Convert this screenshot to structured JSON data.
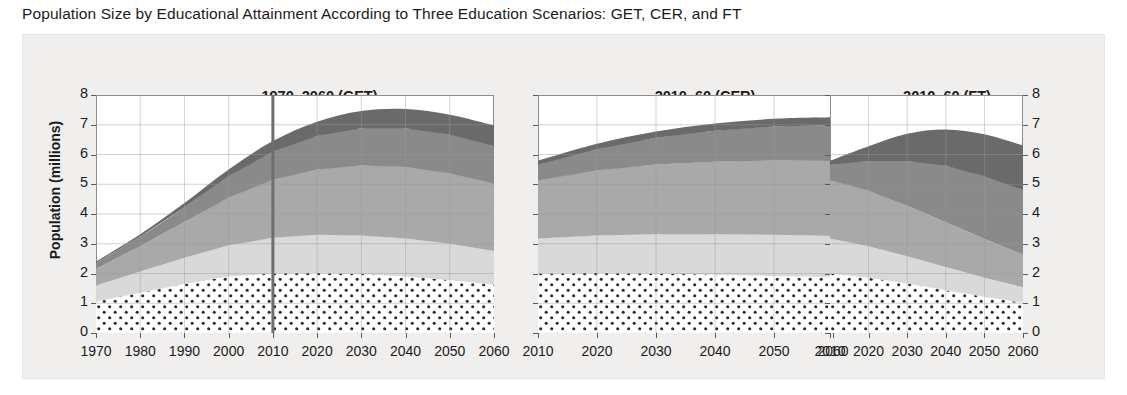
{
  "figure": {
    "title": "Population Size by Educational Attainment According to Three Education Scenarios: GET, CER, and FT",
    "ylabel": "Population (millions)",
    "background_color": "#f0efed",
    "axis_color": "#8d8d8d",
    "grid_color": "#9a9a9a",
    "marker_line_color": "#6e6e6e"
  },
  "yticks": [
    "0",
    "1",
    "2",
    "3",
    "4",
    "5",
    "6",
    "7",
    "8"
  ],
  "chart_data": {
    "type": "area",
    "title": "Population Size by Educational Attainment According to Three Education Scenarios: GET, CER, and FT",
    "ylabel": "Population (millions)",
    "xlabel": "",
    "ylim": [
      0,
      8
    ],
    "grid": true,
    "legend_position": "none",
    "stacked": true,
    "series_order_bottom_to_top": [
      "No education",
      "Primary",
      "Secondary",
      "Post-secondary",
      "Tertiary"
    ],
    "series_colors": {
      "No education": "#ffffff",
      "Primary": "#d9d9d9",
      "Secondary": "#a9a9a9",
      "Post-secondary": "#8a8a8a",
      "Tertiary": "#6a6a6a"
    },
    "panels": [
      {
        "id": "get",
        "title": "1970–2060 (GET)",
        "xlim": [
          1970,
          2060
        ],
        "xticks": [
          "1970",
          "1980",
          "1990",
          "2000",
          "2010",
          "2020",
          "2030",
          "2040",
          "2050",
          "2060"
        ],
        "marker_line_x": 2010,
        "x": [
          1970,
          1980,
          1990,
          2000,
          2010,
          2020,
          2030,
          2040,
          2050,
          2060
        ],
        "series": [
          {
            "name": "No education",
            "values": [
              1.05,
              1.35,
              1.65,
              1.9,
              2.0,
              2.02,
              1.98,
              1.9,
              1.78,
              1.62
            ]
          },
          {
            "name": "Primary",
            "values": [
              0.55,
              0.72,
              0.88,
              1.05,
              1.2,
              1.28,
              1.3,
              1.28,
              1.22,
              1.14
            ]
          },
          {
            "name": "Secondary",
            "values": [
              0.55,
              0.85,
              1.2,
              1.6,
              1.95,
              2.2,
              2.35,
              2.4,
              2.36,
              2.26
            ]
          },
          {
            "name": "Post-secondary",
            "values": [
              0.2,
              0.32,
              0.5,
              0.72,
              0.95,
              1.12,
              1.25,
              1.3,
              1.3,
              1.26
            ]
          },
          {
            "name": "Tertiary",
            "values": [
              0.05,
              0.08,
              0.14,
              0.23,
              0.35,
              0.48,
              0.58,
              0.65,
              0.68,
              0.7
            ]
          }
        ],
        "totals": [
          2.4,
          3.32,
          4.37,
          5.5,
          6.45,
          7.1,
          7.46,
          7.53,
          7.34,
          6.98
        ]
      },
      {
        "id": "cer",
        "title": "2010–60 (CER)",
        "xlim": [
          2010,
          2060
        ],
        "xticks": [
          "2010",
          "2020",
          "2030",
          "2040",
          "2050",
          "2060"
        ],
        "marker_line_x": null,
        "x": [
          2010,
          2020,
          2030,
          2040,
          2050,
          2060
        ],
        "series": [
          {
            "name": "No education",
            "values": [
              2.0,
              2.02,
              2.0,
              1.96,
              1.92,
              1.88
            ]
          },
          {
            "name": "Primary",
            "values": [
              1.18,
              1.26,
              1.32,
              1.36,
              1.38,
              1.38
            ]
          },
          {
            "name": "Secondary",
            "values": [
              1.95,
              2.18,
              2.34,
              2.44,
              2.5,
              2.52
            ]
          },
          {
            "name": "Post-secondary",
            "values": [
              0.52,
              0.72,
              0.9,
              1.04,
              1.14,
              1.2
            ]
          },
          {
            "name": "Tertiary",
            "values": [
              0.14,
              0.18,
              0.21,
              0.24,
              0.26,
              0.27
            ]
          }
        ],
        "totals": [
          5.79,
          6.36,
          6.77,
          7.04,
          7.2,
          7.25
        ]
      },
      {
        "id": "ft",
        "title": "2010–60 (FT)",
        "xlim": [
          2010,
          2060
        ],
        "xticks": [
          "2010",
          "2020",
          "2030",
          "2040",
          "2050",
          "2060"
        ],
        "marker_line_x": null,
        "x": [
          2010,
          2020,
          2030,
          2040,
          2050,
          2060
        ],
        "series": [
          {
            "name": "No education",
            "values": [
              2.0,
              1.86,
              1.66,
              1.44,
              1.22,
              1.02
            ]
          },
          {
            "name": "Primary",
            "values": [
              1.18,
              1.06,
              0.92,
              0.78,
              0.64,
              0.52
            ]
          },
          {
            "name": "Secondary",
            "values": [
              1.95,
              1.86,
              1.7,
              1.5,
              1.3,
              1.1
            ]
          },
          {
            "name": "Post-secondary",
            "values": [
              0.52,
              1.0,
              1.5,
              1.9,
              2.1,
              2.16
            ]
          },
          {
            "name": "Tertiary",
            "values": [
              0.14,
              0.5,
              0.92,
              1.22,
              1.42,
              1.5
            ]
          }
        ],
        "totals": [
          5.79,
          6.28,
          6.7,
          6.84,
          6.68,
          6.3
        ]
      }
    ]
  }
}
